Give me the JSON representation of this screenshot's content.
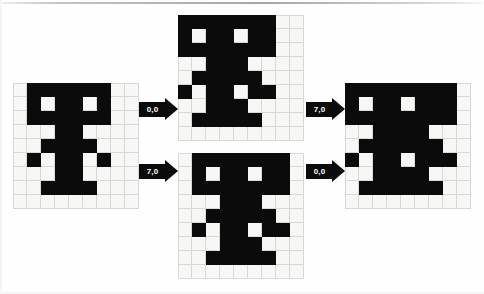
{
  "diagram": {
    "grid_size": {
      "cols": 9,
      "rows": 9
    },
    "colors": {
      "cell_on": "#0b0b0b",
      "cell_off": "#f7f7f5",
      "grid_line": "#d8d8d6",
      "arrow": "#0b0b0b",
      "arrow_text": "#ffffff",
      "background": "#fefefe"
    }
  },
  "grids": {
    "source": {
      "name": "source-grid",
      "rows": [
        [
          0,
          1,
          1,
          1,
          1,
          1,
          1,
          0,
          0
        ],
        [
          0,
          1,
          0,
          1,
          1,
          0,
          1,
          0,
          0
        ],
        [
          0,
          1,
          1,
          1,
          1,
          1,
          1,
          0,
          0
        ],
        [
          0,
          0,
          0,
          1,
          1,
          0,
          0,
          0,
          0
        ],
        [
          0,
          0,
          1,
          1,
          1,
          1,
          0,
          0,
          0
        ],
        [
          0,
          1,
          0,
          1,
          1,
          0,
          1,
          0,
          0
        ],
        [
          0,
          0,
          0,
          1,
          1,
          0,
          0,
          0,
          0
        ],
        [
          0,
          0,
          1,
          1,
          1,
          1,
          0,
          0,
          0
        ],
        [
          0,
          0,
          0,
          0,
          0,
          0,
          0,
          0,
          0
        ]
      ]
    },
    "top_middle": {
      "name": "top-middle-grid",
      "rows": [
        [
          1,
          1,
          1,
          1,
          1,
          1,
          1,
          0,
          0
        ],
        [
          1,
          0,
          1,
          1,
          0,
          1,
          1,
          0,
          0
        ],
        [
          1,
          1,
          1,
          1,
          1,
          1,
          1,
          0,
          0
        ],
        [
          0,
          0,
          1,
          1,
          1,
          0,
          0,
          0,
          0
        ],
        [
          0,
          1,
          1,
          1,
          1,
          1,
          0,
          0,
          0
        ],
        [
          1,
          0,
          1,
          1,
          0,
          1,
          1,
          0,
          0
        ],
        [
          0,
          0,
          1,
          1,
          1,
          0,
          0,
          0,
          0
        ],
        [
          0,
          1,
          1,
          1,
          1,
          1,
          0,
          0,
          0
        ],
        [
          0,
          0,
          0,
          0,
          0,
          0,
          0,
          0,
          0
        ]
      ]
    },
    "bottom_middle": {
      "name": "bottom-middle-grid",
      "rows": [
        [
          0,
          1,
          1,
          1,
          1,
          1,
          1,
          1,
          0
        ],
        [
          0,
          1,
          0,
          1,
          1,
          0,
          1,
          1,
          0
        ],
        [
          0,
          1,
          1,
          1,
          1,
          1,
          1,
          1,
          0
        ],
        [
          0,
          0,
          0,
          1,
          1,
          1,
          0,
          0,
          0
        ],
        [
          0,
          0,
          1,
          1,
          1,
          1,
          1,
          0,
          0
        ],
        [
          0,
          1,
          0,
          1,
          1,
          0,
          1,
          1,
          0
        ],
        [
          0,
          0,
          0,
          1,
          1,
          1,
          0,
          0,
          0
        ],
        [
          0,
          0,
          1,
          1,
          1,
          1,
          1,
          0,
          0
        ],
        [
          0,
          0,
          0,
          0,
          0,
          0,
          0,
          0,
          0
        ]
      ]
    },
    "result": {
      "name": "result-grid",
      "rows": [
        [
          1,
          1,
          1,
          1,
          1,
          1,
          1,
          1,
          0
        ],
        [
          1,
          0,
          1,
          1,
          0,
          1,
          1,
          1,
          0
        ],
        [
          1,
          1,
          1,
          1,
          1,
          1,
          1,
          1,
          0
        ],
        [
          0,
          0,
          1,
          1,
          1,
          1,
          0,
          0,
          0
        ],
        [
          0,
          1,
          1,
          1,
          1,
          1,
          1,
          0,
          0
        ],
        [
          1,
          0,
          1,
          1,
          0,
          1,
          1,
          1,
          0
        ],
        [
          0,
          0,
          1,
          1,
          1,
          1,
          0,
          0,
          0
        ],
        [
          0,
          1,
          1,
          1,
          1,
          1,
          1,
          0,
          0
        ],
        [
          0,
          0,
          0,
          0,
          0,
          0,
          0,
          0,
          0
        ]
      ]
    }
  },
  "arrows": {
    "source_to_top": {
      "label": "0,0",
      "name": "arrow-source-to-top"
    },
    "source_to_bottom": {
      "label": "7,0",
      "name": "arrow-source-to-bottom"
    },
    "top_to_result": {
      "label": "7,0",
      "name": "arrow-top-to-result"
    },
    "bottom_to_result": {
      "label": "0,0",
      "name": "arrow-bottom-to-result"
    }
  }
}
